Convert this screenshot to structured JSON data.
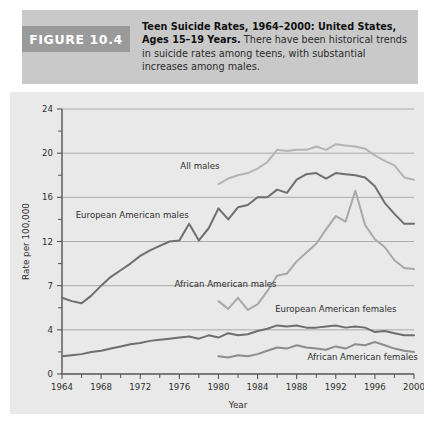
{
  "figure": {
    "badge_label": "FIGURE 10.4",
    "caption_lead": "Teen Suicide Rates, 1964–2000: United States, Ages 15–19 Years.",
    "caption_body": " There have been historical trends in suicide rates among teens, with substantial increases among males."
  },
  "colors": {
    "panel_background": "#e9e9e9",
    "caption_background": "#c9c9c9",
    "badge_background": "#9a9a9a",
    "axis": "#555555",
    "gridline": "#9b9b9b",
    "all_males": "#b4b4b4",
    "european_american_males": "#6e6e6e",
    "african_american_males": "#a8a8a8",
    "european_american_females": "#6e6e6e",
    "african_american_females": "#8c8c8c"
  },
  "chart_data": {
    "type": "line",
    "title": "Teen Suicide Rates, 1964–2000: United States, Ages 15–19 Years",
    "xlabel": "Year",
    "ylabel": "Rate per 100,000",
    "xlim": [
      1964,
      2000
    ],
    "ylim": [
      0,
      24
    ],
    "grid": true,
    "legend_position": "inline-labels",
    "ytick_labels": [
      "0",
      "4",
      "7",
      "12",
      "16",
      "20",
      "24"
    ],
    "ytick_values": [
      0,
      4,
      8,
      12,
      16,
      20,
      24
    ],
    "yminor_ticks": [
      2,
      6,
      10,
      14,
      18,
      22
    ],
    "xtick_labels": [
      "1964",
      "1968",
      "1972",
      "1976",
      "1980",
      "1984",
      "1988",
      "1992",
      "1996",
      "2000"
    ],
    "xtick_values": [
      1964,
      1968,
      1972,
      1976,
      1980,
      1984,
      1988,
      1992,
      1996,
      2000
    ],
    "xminor_ticks": [
      1966,
      1970,
      1974,
      1978,
      1982,
      1986,
      1990,
      1994,
      1998
    ],
    "x": [
      1964,
      1965,
      1966,
      1967,
      1968,
      1969,
      1970,
      1971,
      1972,
      1973,
      1974,
      1975,
      1976,
      1977,
      1978,
      1979,
      1980,
      1981,
      1982,
      1983,
      1984,
      1985,
      1986,
      1987,
      1988,
      1989,
      1990,
      1991,
      1992,
      1993,
      1994,
      1995,
      1996,
      1997,
      1998,
      1999,
      2000
    ],
    "series": [
      {
        "name": "All males",
        "label": "All males",
        "color": "#b4b4b4",
        "label_x": 1976.1,
        "label_y": 18.6,
        "x_start": 1980,
        "values": [
          null,
          null,
          null,
          null,
          null,
          null,
          null,
          null,
          null,
          null,
          null,
          null,
          null,
          null,
          null,
          null,
          17.2,
          17.7,
          18.0,
          18.2,
          18.6,
          19.2,
          20.3,
          20.2,
          20.3,
          20.3,
          20.6,
          20.3,
          20.8,
          20.7,
          20.6,
          20.4,
          19.8,
          19.3,
          18.9,
          17.8,
          17.6
        ]
      },
      {
        "name": "European American males",
        "label": "European American males",
        "color": "#6e6e6e",
        "label_x": 1965.4,
        "label_y": 14.1,
        "x_start": 1964,
        "values": [
          6.9,
          6.6,
          6.4,
          7.1,
          8.0,
          8.8,
          9.4,
          10.0,
          10.7,
          11.2,
          11.6,
          12.0,
          12.1,
          13.6,
          12.1,
          13.2,
          15.0,
          14.0,
          15.1,
          15.3,
          16.0,
          16.0,
          16.7,
          16.4,
          17.6,
          18.1,
          18.2,
          17.7,
          18.2,
          18.1,
          18.0,
          17.8,
          17.0,
          15.5,
          14.5,
          13.6,
          13.6
        ]
      },
      {
        "name": "African American males",
        "label": "African American males",
        "color": "#a8a8a8",
        "label_x": 1975.5,
        "label_y": 7.9,
        "x_start": 1980,
        "values": [
          null,
          null,
          null,
          null,
          null,
          null,
          null,
          null,
          null,
          null,
          null,
          null,
          null,
          null,
          null,
          null,
          6.6,
          5.9,
          6.9,
          5.8,
          6.3,
          7.5,
          8.9,
          9.1,
          10.2,
          11.0,
          11.8,
          13.1,
          14.3,
          13.8,
          16.6,
          13.5,
          12.2,
          11.5,
          10.3,
          9.6,
          9.5
        ]
      },
      {
        "name": "European American females",
        "label": "European American females",
        "color": "#6e6e6e",
        "label_x": 1985.8,
        "label_y": 5.6,
        "x_start": 1964,
        "values": [
          1.6,
          1.7,
          1.8,
          2.0,
          2.1,
          2.3,
          2.5,
          2.7,
          2.8,
          3.0,
          3.1,
          3.2,
          3.3,
          3.4,
          3.2,
          3.5,
          3.3,
          3.7,
          3.5,
          3.6,
          3.9,
          4.1,
          4.4,
          4.3,
          4.4,
          4.2,
          4.2,
          4.3,
          4.4,
          4.2,
          4.3,
          4.2,
          3.8,
          3.9,
          3.7,
          3.5,
          3.5
        ]
      },
      {
        "name": "African American females",
        "label": "African American females",
        "color": "#8c8c8c",
        "label_x": 1989.1,
        "label_y": 1.3,
        "x_start": 1980,
        "values": [
          null,
          null,
          null,
          null,
          null,
          null,
          null,
          null,
          null,
          null,
          null,
          null,
          null,
          null,
          null,
          null,
          1.6,
          1.5,
          1.7,
          1.6,
          1.8,
          2.1,
          2.4,
          2.3,
          2.6,
          2.4,
          2.3,
          2.2,
          2.5,
          2.3,
          2.7,
          2.6,
          2.9,
          2.6,
          2.3,
          2.1,
          2.0
        ]
      }
    ]
  }
}
